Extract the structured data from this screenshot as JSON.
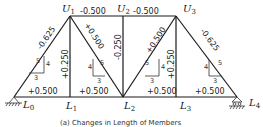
{
  "diagram": {
    "type": "truss",
    "caption": "(a) Changes in Length of Members",
    "nodes": {
      "L0": {
        "label": "L",
        "sub": "0"
      },
      "L1": {
        "label": "L",
        "sub": "1"
      },
      "L2": {
        "label": "L",
        "sub": "2"
      },
      "L3": {
        "label": "L",
        "sub": "3"
      },
      "L4": {
        "label": "L",
        "sub": "4"
      },
      "U1": {
        "label": "U",
        "sub": "1"
      },
      "U2": {
        "label": "U",
        "sub": "2"
      },
      "U3": {
        "label": "U",
        "sub": "3"
      }
    },
    "members": {
      "U1U2": "-0.500",
      "U2U3": "-0.500",
      "L0U1": "-0.625",
      "U3L4": "-0.625",
      "U1L2": "+0.500",
      "L2U3": "+0.500",
      "U1L1": "+0.250",
      "U2L2": "-0.250",
      "U3L3": "+0.250",
      "L0L1": "+0.500",
      "L1L2": "+0.500",
      "L2L3": "+0.500",
      "L3L4": "+0.500"
    },
    "slope_triangles": [
      {
        "hyp": "5",
        "rise": "4",
        "run": "3"
      },
      {
        "hyp": "5",
        "rise": "4",
        "run": "3"
      },
      {
        "hyp": "5",
        "rise": "4",
        "run": "3"
      },
      {
        "hyp": "5",
        "rise": "4",
        "run": "3"
      }
    ],
    "supports": {
      "left": "pin",
      "right": "roller"
    }
  }
}
